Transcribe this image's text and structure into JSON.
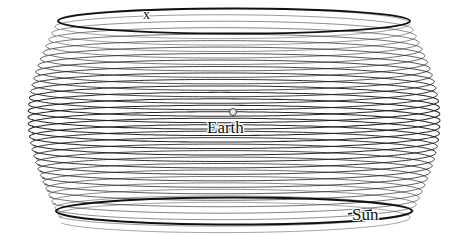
{
  "figure": {
    "title": "",
    "background_color": "#ffffff",
    "ink_color": "#1a1a1a",
    "width": 465,
    "height": 235
  },
  "labels": {
    "axis": "x",
    "earth": "Earth",
    "sun": "Sun"
  },
  "markers": {
    "earth_dot": {
      "name": "earth-marker",
      "cx": 233,
      "cy": 112,
      "r": 4,
      "stroke": "#3c3c3c",
      "fill": "#e8e8e8"
    }
  },
  "chart_data": {
    "type": "line",
    "xlabel": "x",
    "ylabel": "",
    "grid": false,
    "legend": "none",
    "annotations": [
      {
        "text": "x",
        "x": 148,
        "y": 16,
        "role": "axis-label"
      },
      {
        "text": "Earth",
        "x": 233,
        "y": 128,
        "role": "object-label"
      },
      {
        "text": "Sun",
        "x": 368,
        "y": 216,
        "role": "object-label"
      }
    ],
    "series": [
      {
        "name": "earth-helix-coil",
        "description": "Earth traces a helix about the Sun's line of travel; the drawing axis runs vertically down the page while each loop is an ellipse seen nearly edge-on.",
        "coil_count": 31,
        "coil_top_y": 20,
        "coil_bottom_y": 214,
        "coil_pitch": 6.3,
        "center_x": 234,
        "ellipse_rx_max": 206,
        "ellipse_rx_min": 176,
        "ellipse_ry": 13.5,
        "barrel_waist_bulge": 30,
        "phase_offset_deg": 168,
        "stroke_width": 0.85
      },
      {
        "name": "top-rim-ellipse",
        "description": "Heavier closing ellipse at the top of the barrel",
        "cy": 21,
        "rx": 176,
        "ry": 12.5,
        "stroke_width": 1.9
      },
      {
        "name": "bottom-rim-ellipse",
        "description": "Heavier closing ellipse at the bottom of the barrel",
        "cy": 211,
        "rx": 178,
        "ry": 13.5,
        "stroke_width": 2.1
      }
    ],
    "xlim": [
      0,
      465
    ],
    "ylim": [
      235,
      0
    ]
  },
  "leaders": {
    "sun_leader": {
      "x1": 348,
      "y1": 214,
      "x2": 372,
      "y2": 210
    }
  }
}
